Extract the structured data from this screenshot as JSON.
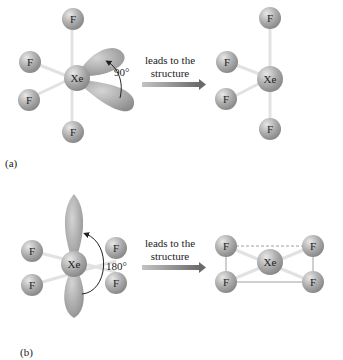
{
  "panels": [
    {
      "label": "(a)",
      "arrow_text_line1": "leads to the",
      "arrow_text_line2": "structure",
      "angle": "90°",
      "central_atom": "Xe",
      "ligand": "F"
    },
    {
      "label": "(b)",
      "arrow_text_line1": "leads to the",
      "arrow_text_line2": "structure",
      "angle": "180°",
      "central_atom": "Xe",
      "ligand": "F"
    }
  ],
  "colors": {
    "atom": "#a8a8a8",
    "lobe": "#a0a0a0",
    "bond": "#e0e0e0",
    "arrow_start": "#bdbdbd",
    "arrow_end": "#6d6d6d"
  }
}
